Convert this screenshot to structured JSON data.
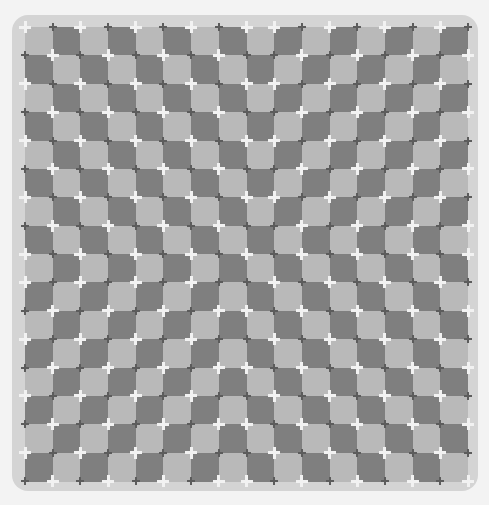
{
  "illusion": {
    "rows": 16,
    "cols": 16,
    "colors": {
      "background": "#f3f3f3",
      "frame": "#d4d4d4",
      "light_square": "#b9b9b9",
      "dark_square": "#7f7f7f",
      "cross": "#f2f2f2",
      "notch": "#5c5c5c"
    }
  }
}
